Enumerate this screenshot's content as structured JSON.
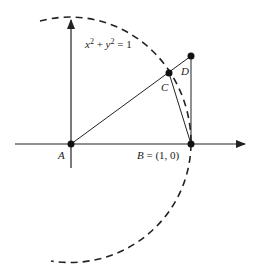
{
  "diagram": {
    "equation_base_x": "x",
    "equation_exp": "2",
    "equation_plus": " + ",
    "equation_base_y": "y",
    "equation_exp2": "2",
    "equation_rhs": " = 1",
    "point_A": "A",
    "point_B": "B",
    "point_B_coords": " = (1, 0)",
    "point_C": "C",
    "point_D": "D"
  },
  "colors": {
    "stroke": "#222222",
    "background": "#ffffff"
  }
}
